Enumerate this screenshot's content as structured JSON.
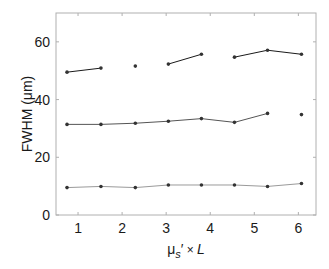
{
  "chart_data": {
    "type": "line",
    "title": "",
    "xlabel": "μs′ × L",
    "xlabel_parts": {
      "mu": "μ",
      "sub": "s",
      "prime": "′",
      "times": " × ",
      "L": "L"
    },
    "ylabel": "FWHM (μm)",
    "xlim": [
      0.5,
      6.4
    ],
    "ylim": [
      0,
      70
    ],
    "xticks": [
      1,
      2,
      3,
      4,
      5,
      6
    ],
    "yticks": [
      0,
      20,
      40,
      60
    ],
    "grid": false,
    "legend": null,
    "x": [
      0.75,
      1.52,
      2.3,
      3.05,
      3.8,
      4.55,
      5.3,
      6.07
    ],
    "series": [
      {
        "name": "top",
        "color": "#1a1a1a",
        "values": [
          49.5,
          50.9,
          51.6,
          52.3,
          55.7,
          54.7,
          57.1,
          55.7
        ],
        "segments": [
          [
            0,
            1
          ],
          [
            2
          ],
          [
            3,
            4
          ],
          [
            5,
            6,
            7
          ]
        ]
      },
      {
        "name": "middle",
        "color": "#555555",
        "values": [
          31.4,
          31.4,
          31.8,
          32.5,
          33.4,
          32.1,
          35.2,
          34.8
        ],
        "segments": [
          [
            0,
            1,
            2,
            3,
            4,
            5,
            6
          ],
          [
            7
          ]
        ]
      },
      {
        "name": "bottom",
        "color": "#9a9a9a",
        "values": [
          9.5,
          9.9,
          9.5,
          10.4,
          10.4,
          10.4,
          9.9,
          10.9
        ],
        "segments": [
          [
            0,
            1,
            2,
            3,
            4,
            5,
            6,
            7
          ]
        ]
      }
    ]
  }
}
